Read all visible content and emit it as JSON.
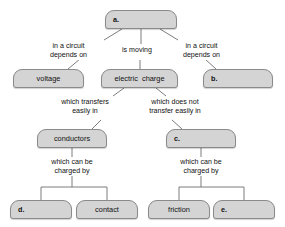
{
  "diagram": {
    "style": {
      "node_fill": "#d4d4d4",
      "node_border": "#8a8a8a",
      "line_color": "#7d7d7d",
      "text_color": "#111111",
      "background": "#ffffff"
    },
    "nodes": [
      {
        "id": "a",
        "label": "a.",
        "align": "left",
        "blank": true,
        "x": 105,
        "y": 10,
        "w": 72,
        "h": 19
      },
      {
        "id": "voltage",
        "label": "voltage",
        "align": "center",
        "blank": false,
        "x": 13,
        "y": 69,
        "w": 71,
        "h": 19
      },
      {
        "id": "electric_charge",
        "label": "electric  charge",
        "align": "center",
        "blank": false,
        "x": 101,
        "y": 69,
        "w": 77,
        "h": 19
      },
      {
        "id": "b",
        "label": "b.",
        "align": "left",
        "blank": true,
        "x": 203,
        "y": 69,
        "w": 70,
        "h": 19
      },
      {
        "id": "conductors",
        "label": "conductors",
        "align": "center",
        "blank": false,
        "x": 37,
        "y": 129,
        "w": 70,
        "h": 19
      },
      {
        "id": "c",
        "label": "c.",
        "align": "left",
        "blank": true,
        "x": 166,
        "y": 129,
        "w": 70,
        "h": 19
      },
      {
        "id": "d",
        "label": "d.",
        "align": "left",
        "blank": true,
        "x": 10,
        "y": 200,
        "w": 62,
        "h": 19
      },
      {
        "id": "contact",
        "label": "contact",
        "align": "center",
        "blank": false,
        "x": 76,
        "y": 200,
        "w": 62,
        "h": 19
      },
      {
        "id": "friction",
        "label": "friction",
        "align": "center",
        "blank": false,
        "x": 148,
        "y": 200,
        "w": 62,
        "h": 19
      },
      {
        "id": "e",
        "label": "e.",
        "align": "left",
        "blank": true,
        "x": 213,
        "y": 200,
        "w": 62,
        "h": 19
      }
    ],
    "edge_labels": [
      {
        "id": "label-a-voltage",
        "text": "in a circuit\ndepends on",
        "x": 41,
        "y": 42,
        "w": 55
      },
      {
        "id": "label-a-electric-charge",
        "text": "is moving",
        "x": 113,
        "y": 46,
        "w": 48
      },
      {
        "id": "label-a-b",
        "text": "in a circuit\ndepends on",
        "x": 174,
        "y": 42,
        "w": 55
      },
      {
        "id": "label-charge-conductors",
        "text": "which transfers\neasily in",
        "x": 54,
        "y": 98,
        "w": 62
      },
      {
        "id": "label-charge-c",
        "text": "which does not\ntransfer easily in",
        "x": 139,
        "y": 98,
        "w": 72
      },
      {
        "id": "label-conductors-charged",
        "text": "which can be\ncharged by",
        "x": 43,
        "y": 158,
        "w": 58
      },
      {
        "id": "label-c-charged",
        "text": "which can be\ncharged by",
        "x": 172,
        "y": 158,
        "w": 58
      }
    ],
    "connectors": [
      {
        "id": "a-to-voltage",
        "path": "M 122 29 L 104 40"
      },
      {
        "id": "a-to-charge",
        "path": "M 141 29 L 141 44"
      },
      {
        "id": "a-to-b",
        "path": "M 160 29 L 178 40"
      },
      {
        "id": "voltage-stub",
        "path": "M 68 69 L 80 59"
      },
      {
        "id": "charge-stub",
        "path": "M 140 69 L 140 60"
      },
      {
        "id": "b-stub",
        "path": "M 216 69 L 205 59"
      },
      {
        "id": "charge-to-conductors",
        "path": "M 124 88 L 113 96"
      },
      {
        "id": "charge-to-c",
        "path": "M 156 88 L 166 96"
      },
      {
        "id": "conductors-stub",
        "path": "M 92 129 L 101 120"
      },
      {
        "id": "c-stub",
        "path": "M 182 129 L 172 120"
      },
      {
        "id": "conductors-down",
        "path": "M 72 148 L 72 157"
      },
      {
        "id": "conductors-to-split",
        "path": "M 72 176 L 72 187"
      },
      {
        "id": "split-left-bar",
        "path": "M 41 187 L 107 187"
      },
      {
        "id": "split-left-down-1",
        "path": "M 41 187 L 41 200"
      },
      {
        "id": "split-left-down-2",
        "path": "M 107 187 L 107 200"
      },
      {
        "id": "c-down",
        "path": "M 201 148 L 201 157"
      },
      {
        "id": "c-to-split",
        "path": "M 201 176 L 201 187"
      },
      {
        "id": "split-right-bar",
        "path": "M 179 187 L 244 187"
      },
      {
        "id": "split-right-down-1",
        "path": "M 179 187 L 179 200"
      },
      {
        "id": "split-right-down-2",
        "path": "M 244 187 L 244 200"
      }
    ]
  }
}
